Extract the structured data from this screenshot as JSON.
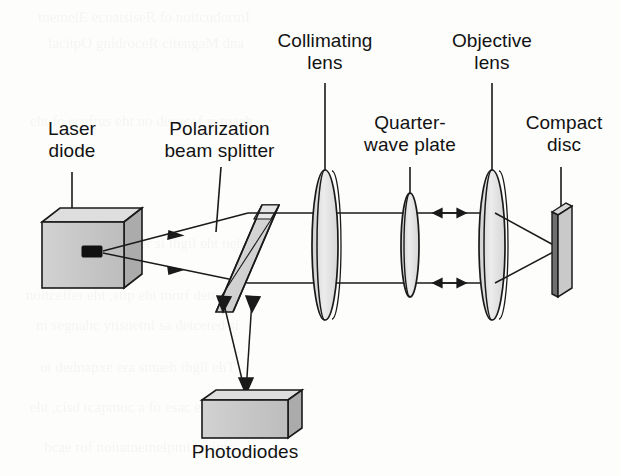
{
  "figure": {
    "background_color": "#fdfdfc",
    "ink_color": "#1a1a1a",
    "body_fill": "#c8c8c8",
    "body_fill_light": "#dcdcdc",
    "body_fill_dark": "#a9a9a9",
    "glass_fill": "#e3e3e3",
    "emitter_color": "#111111"
  },
  "labels": {
    "laser_diode": "Laser\ndiode",
    "polarization_beam_splitter": "Polarization\nbeam splitter",
    "collimating_lens": "Collimating\nlens",
    "quarter_wave_plate": "Quarter-\nwave plate",
    "objective_lens": "Objective\nlens",
    "compact_disc": "Compact\ndisc",
    "photodiodes": "Photodiodes"
  },
  "components": [
    {
      "id": "laser-diode",
      "label": "Laser diode",
      "kind": "box-3d",
      "x": 42,
      "y": 208,
      "width": 82,
      "height": 80
    },
    {
      "id": "polarization-beam-splitter",
      "label": "Polarization beam splitter",
      "kind": "tilted-slab",
      "x": 205,
      "y": 205,
      "width": 72,
      "height": 110
    },
    {
      "id": "collimating-lens",
      "label": "Collimating lens",
      "kind": "biconvex-lens",
      "cx": 325,
      "cy": 245,
      "rx": 13,
      "ry": 75
    },
    {
      "id": "quarter-wave-plate",
      "label": "Quarter-wave plate",
      "kind": "thin-plate",
      "cx": 410,
      "cy": 245,
      "rx": 9,
      "ry": 52
    },
    {
      "id": "objective-lens",
      "label": "Objective lens",
      "kind": "biconvex-lens",
      "cx": 492,
      "cy": 245,
      "rx": 13,
      "ry": 75
    },
    {
      "id": "compact-disc",
      "label": "Compact disc",
      "kind": "vertical-slab",
      "x": 552,
      "y": 203,
      "width": 18,
      "height": 86
    },
    {
      "id": "photodiodes",
      "label": "Photodiodes",
      "kind": "box-3d",
      "x": 202,
      "y": 390,
      "width": 86,
      "height": 48
    }
  ],
  "beams": [
    {
      "id": "beam-upper-outgoing",
      "from": "laser-diode",
      "to": "polarization-beam-splitter",
      "direction": "right",
      "arrow": "single"
    },
    {
      "id": "beam-lower-outgoing",
      "from": "laser-diode",
      "to": "polarization-beam-splitter",
      "direction": "right",
      "arrow": "single"
    },
    {
      "id": "beam-upper-collimated",
      "from": "polarization-beam-splitter",
      "to": "objective-lens",
      "direction": "right",
      "arrow": "double"
    },
    {
      "id": "beam-lower-collimated",
      "from": "polarization-beam-splitter",
      "to": "objective-lens",
      "direction": "right",
      "arrow": "double"
    },
    {
      "id": "beam-focus-upper",
      "from": "objective-lens",
      "to": "compact-disc",
      "direction": "right",
      "arrow": "none"
    },
    {
      "id": "beam-focus-lower",
      "from": "objective-lens",
      "to": "compact-disc",
      "direction": "right",
      "arrow": "none"
    },
    {
      "id": "beam-reflected-left",
      "from": "polarization-beam-splitter",
      "to": "photodiodes",
      "direction": "down",
      "arrow": "single"
    },
    {
      "id": "beam-reflected-right",
      "from": "polarization-beam-splitter",
      "to": "photodiodes",
      "direction": "down",
      "arrow": "single"
    }
  ],
  "leader_lines": [
    {
      "for": "laser-diode",
      "x1": 72,
      "y1": 172,
      "x2": 72,
      "y2": 225
    },
    {
      "for": "polarization-beam-splitter",
      "x1": 219,
      "y1": 167,
      "x2": 219,
      "y2": 228
    },
    {
      "for": "collimating-lens",
      "x1": 325,
      "y1": 83,
      "x2": 325,
      "y2": 178
    },
    {
      "for": "quarter-wave-plate",
      "x1": 410,
      "y1": 167,
      "x2": 410,
      "y2": 196
    },
    {
      "for": "objective-lens",
      "x1": 492,
      "y1": 83,
      "x2": 492,
      "y2": 178
    },
    {
      "for": "compact-disc",
      "x1": 561,
      "y1": 167,
      "x2": 561,
      "y2": 206
    }
  ],
  "label_positions": {
    "laser_diode": {
      "left": 18,
      "top": 118,
      "width": 108
    },
    "polarization_beam_splitter": {
      "left": 152,
      "top": 118,
      "width": 135
    },
    "collimating_lens": {
      "left": 262,
      "top": 30,
      "width": 126
    },
    "quarter_wave_plate": {
      "left": 345,
      "top": 112,
      "width": 130
    },
    "objective_lens": {
      "left": 436,
      "top": 30,
      "width": 112
    },
    "compact_disc": {
      "left": 512,
      "top": 112,
      "width": 104
    },
    "photodiodes": {
      "left": 185,
      "top": 441,
      "width": 120
    }
  }
}
